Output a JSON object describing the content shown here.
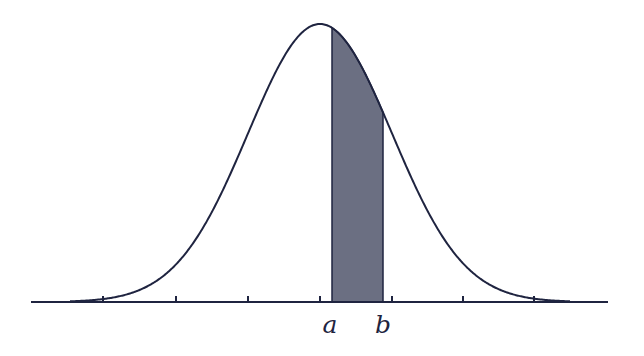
{
  "diagram": {
    "type": "normal-distribution-area",
    "colors": {
      "curve": "#1f2440",
      "axis": "#1f2440",
      "shade": "#6b6f82",
      "background": "#ffffff"
    },
    "curve": {
      "mean_px": 320,
      "sigma_px": 72,
      "baseline_y": 302,
      "peak_y": 24,
      "x_start": 70,
      "x_end": 570
    },
    "axis": {
      "x_start": 31,
      "x_end": 608,
      "y": 302,
      "ticks_px": [
        103,
        176,
        248,
        320,
        392,
        463,
        534
      ],
      "tick_height": 6
    },
    "shaded_region": {
      "x_from": 332,
      "x_to": 383
    },
    "labels": [
      {
        "id": "a",
        "text": "a",
        "x": 330,
        "y": 312
      },
      {
        "id": "b",
        "text": "b",
        "x": 383,
        "y": 312
      }
    ]
  }
}
